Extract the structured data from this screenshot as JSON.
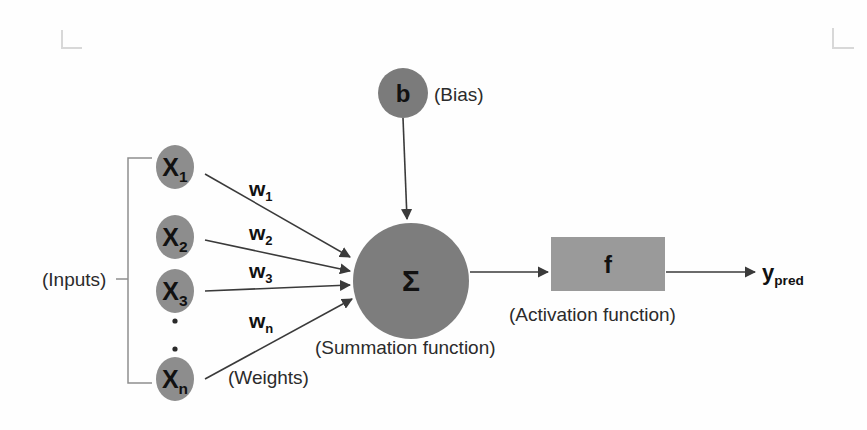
{
  "diagram": {
    "colors": {
      "input_node_fill": "#8d8d8d",
      "bias_node_fill": "#7b7b7b",
      "sum_node_fill": "#7d7d7d",
      "activation_box_fill": "#9a9a9a",
      "line": "#3a3a3a",
      "bracket": "#8e8e8e",
      "text": "#111111",
      "background": "#fefefe",
      "cropmark": "#d8d8d8"
    },
    "inputs": {
      "group_label": "(Inputs)",
      "nodes": [
        {
          "base": "X",
          "sub": "1",
          "cx": 175,
          "cy": 167
        },
        {
          "base": "X",
          "sub": "2",
          "cx": 175,
          "cy": 237
        },
        {
          "base": "X",
          "sub": "3",
          "cx": 175,
          "cy": 291
        },
        {
          "base": "X",
          "sub": "n",
          "cx": 175,
          "cy": 379
        }
      ],
      "ellipsis_dots": [
        {
          "cx": 175,
          "cy": 321
        },
        {
          "cx": 175,
          "cy": 349
        }
      ]
    },
    "weights": {
      "group_label": "(Weights)",
      "labels": [
        {
          "base": "w",
          "sub": "1",
          "x": 249,
          "y": 196
        },
        {
          "base": "w",
          "sub": "2",
          "x": 249,
          "y": 240
        },
        {
          "base": "w",
          "sub": "3",
          "x": 249,
          "y": 278
        },
        {
          "base": "w",
          "sub": "n",
          "x": 249,
          "y": 328
        }
      ]
    },
    "bias": {
      "symbol": "b",
      "label": "(Bias)",
      "cx": 403,
      "cy": 93,
      "r": 25
    },
    "summation": {
      "symbol": "Σ",
      "label": "(Summation function)",
      "cx": 411,
      "cy": 281,
      "r": 58
    },
    "activation": {
      "symbol": "f",
      "label": "(Activation function)",
      "x": 551,
      "y": 237,
      "width": 114,
      "height": 54
    },
    "output": {
      "base": "y",
      "sub": "pred",
      "x": 762,
      "y": 277
    }
  }
}
